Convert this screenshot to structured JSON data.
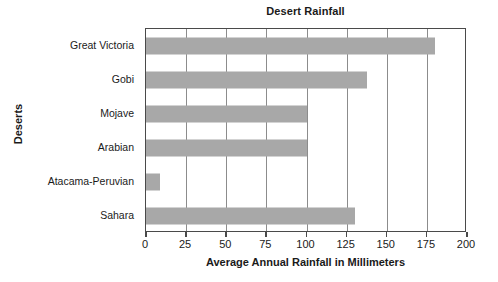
{
  "chart_data": {
    "type": "bar",
    "orientation": "horizontal",
    "title": "Desert Rainfall",
    "xlabel": "Average Annual Rainfall in Millimeters",
    "ylabel": "Deserts",
    "categories": [
      "Great Victoria",
      "Gobi",
      "Mojave",
      "Arabian",
      "Atacama-Peruvian",
      "Sahara"
    ],
    "values": [
      180,
      138,
      100,
      100,
      9,
      130
    ],
    "series": [
      {
        "name": "Average Annual Rainfall in Millimeters",
        "values": [
          180,
          138,
          100,
          100,
          9,
          130
        ]
      }
    ],
    "xlim": [
      0,
      200
    ],
    "xticks": [
      0,
      25,
      50,
      75,
      100,
      125,
      150,
      175,
      200
    ],
    "xtick_labels": [
      "0",
      "25",
      "50",
      "75",
      "100",
      "125",
      "150",
      "175",
      "200"
    ],
    "grid": "vertical",
    "legend": "none",
    "bar_color": "#a8a8a8",
    "axis_color": "#4a4a4a",
    "gridline_color": "#8c8c8c",
    "background_color": "#ffffff",
    "text_color": "#1a1a1a"
  }
}
